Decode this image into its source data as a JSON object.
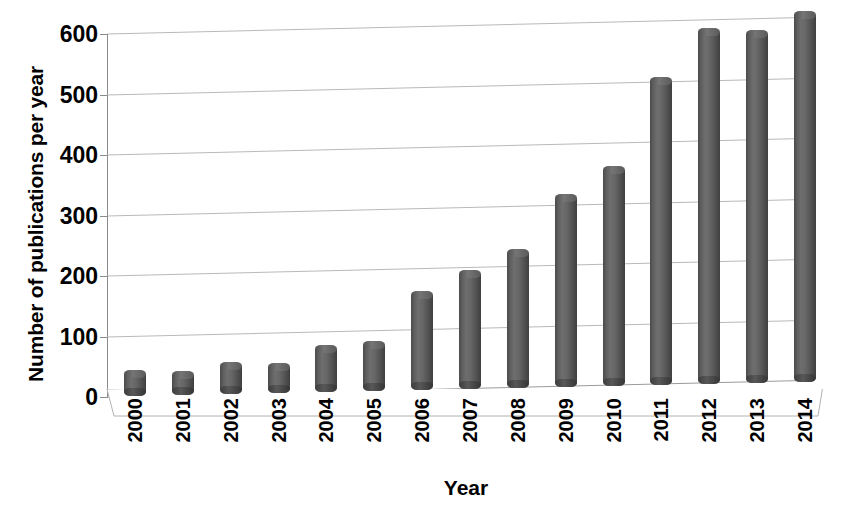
{
  "chart_data": {
    "type": "bar",
    "title": "",
    "xlabel": "Year",
    "ylabel": "Number of publications per year",
    "categories": [
      "2000",
      "2001",
      "2002",
      "2003",
      "2004",
      "2005",
      "2006",
      "2007",
      "2008",
      "2009",
      "2010",
      "2011",
      "2012",
      "2013",
      "2014"
    ],
    "values": [
      30,
      27,
      40,
      37,
      64,
      70,
      150,
      183,
      217,
      305,
      350,
      495,
      575,
      570,
      600
    ],
    "ylim": [
      0,
      600
    ],
    "ytick_labels": [
      "0",
      "100",
      "200",
      "300",
      "400",
      "500",
      "600"
    ],
    "ytick_values": [
      0,
      100,
      200,
      300,
      400,
      500,
      600
    ],
    "ytick_interval": 100,
    "grid": true,
    "legend": false,
    "style": "3d-cylinder-columns",
    "bar_color": "#5e5e5e",
    "gridline_color": "#b9b9b9",
    "axis_color": "#8a8a8a",
    "background_color": "#ffffff"
  }
}
